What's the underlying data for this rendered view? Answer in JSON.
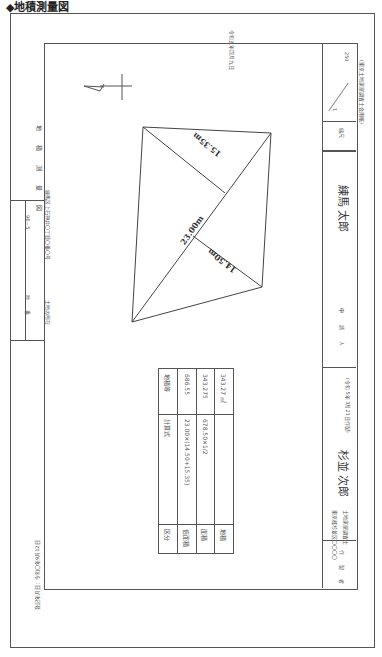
{
  "heading": "◆地積測量図",
  "date_top": "令和五年四月九日",
  "title_block": {
    "title": "地 積 測 量 図",
    "chiban_label": "地  番",
    "chiban_value": "96－5",
    "location_label": "土地の所在",
    "location_value": "練馬区上石神井〇丁目〇番〇号"
  },
  "scale": {
    "label": "縮尺",
    "numerator": "1",
    "denominator": "250"
  },
  "applicant": {
    "label": "申  請  人",
    "name": "練馬  太郎"
  },
  "paper_note": "(東京土地家屋調査士会用紙)",
  "author": {
    "label": "作  製  者",
    "address": "東京都杉並区〇〇〇〇",
    "title": "土地家屋調査士",
    "name": "杉並  次郎",
    "date": "(令和  5年  3月21日作製)"
  },
  "registration_date": "登記年月日：令和〇年9月12日",
  "survey": {
    "diagonal": "23.00m",
    "height1": "15.35m",
    "height2": "14.50m"
  },
  "table": {
    "headers": [
      "区分",
      "計算式",
      "地積等"
    ],
    "rows": [
      [
        "倍面積",
        "23.00×(14.50+15.35)",
        "686.55"
      ],
      [
        "面積",
        "678.50×1/2",
        "343.275"
      ],
      [
        "地積",
        "",
        "343.27 ㎡"
      ]
    ]
  }
}
